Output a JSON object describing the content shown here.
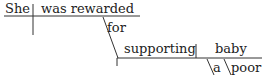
{
  "diagram": {
    "type": "Reed-Kellogg sentence diagram",
    "words": {
      "subject": "She",
      "verb": "was rewarded",
      "preposition": "for",
      "object": "supporting",
      "gerund_object": "baby",
      "modifier1": "a",
      "modifier2": "poor"
    }
  }
}
